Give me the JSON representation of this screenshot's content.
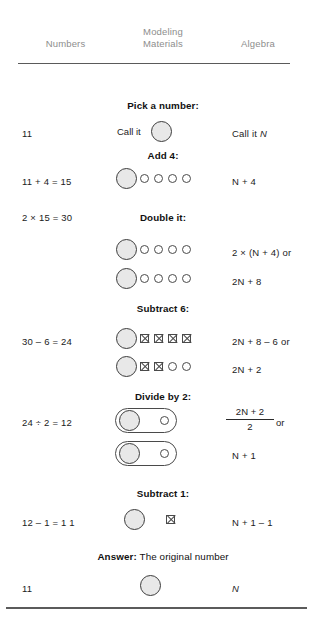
{
  "headers": {
    "numbers": "Numbers",
    "modeling_line1": "Modeling",
    "modeling_line2": "Materials",
    "algebra": "Algebra"
  },
  "steps": {
    "pick": "Pick a number:",
    "add4": "Add 4:",
    "double": "Double it:",
    "subtract6": "Subtract 6:",
    "divide2": "Divide by 2:",
    "subtract1": "Subtract 1:",
    "answer_label": "Answer:",
    "answer_text": "The original number"
  },
  "rows": {
    "pick": {
      "number": "11",
      "model_text": "Call it",
      "algebra_prefix": "Call it",
      "algebra_var": "N"
    },
    "add4": {
      "number": "11 + 4 = 15",
      "algebra": "N + 4"
    },
    "double": {
      "number": "2 × 15 = 30",
      "algebra_a": "2 × (N + 4) or",
      "algebra_b": "2N + 8"
    },
    "subtract6": {
      "number": "30 – 6 = 24",
      "algebra_a": "2N + 8 – 6 or",
      "algebra_b": "2N + 2"
    },
    "divide2": {
      "number": "24 ÷ 2 = 12",
      "fraction_numerator": "2N + 2",
      "fraction_denominator": "2",
      "fraction_or": "or",
      "algebra_b": "N + 1"
    },
    "subtract1": {
      "number": "12 – 1 = 1 1",
      "algebra": "N + 1 – 1"
    },
    "answer": {
      "number": "11",
      "algebra": "N"
    }
  },
  "colors": {
    "header_text": "#8d8d8d",
    "body_text": "#1b1b1b",
    "rule": "#5a5a5a",
    "disc_fill": "#e8e8e8",
    "disc_stroke": "#3c3c3c"
  }
}
